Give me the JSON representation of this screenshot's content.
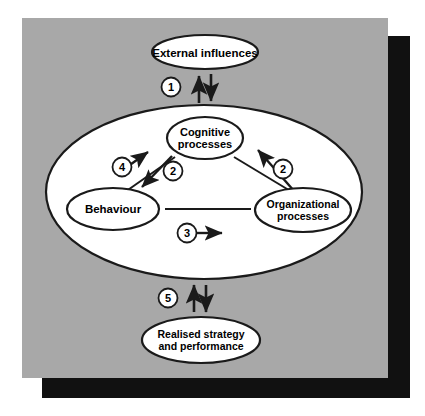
{
  "figure": {
    "panel_color": "#a8a8a8",
    "shadow_color": "#111111",
    "node_fill": "#ffffff",
    "stroke_color": "#1a1a1a",
    "background_color": "#ffffff"
  },
  "nodes": {
    "external": {
      "label": "External influences",
      "lines": [
        "External influences"
      ]
    },
    "cognitive": {
      "label": "Cognitive processes",
      "lines": [
        "Cognitive",
        "processes"
      ]
    },
    "behaviour": {
      "label": "Behaviour",
      "lines": [
        "Behaviour"
      ]
    },
    "organizational": {
      "label": "Organizational processes",
      "lines": [
        "Organizational",
        "processes"
      ]
    },
    "realised": {
      "label": "Realised strategy and performance",
      "lines": [
        "Realised strategy",
        "and performance"
      ]
    }
  },
  "badges": {
    "one": "1",
    "two_left": "2",
    "two_right": "2",
    "three": "3",
    "four": "4",
    "five": "5"
  }
}
